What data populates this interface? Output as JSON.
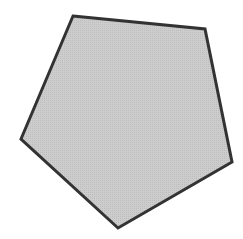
{
  "diagram": {
    "shape": "pentagon",
    "vertices": [
      [
        73,
        16
      ],
      [
        205,
        29
      ],
      [
        232,
        162
      ],
      [
        118,
        228
      ],
      [
        21,
        139
      ]
    ],
    "fill_color": "#c9c9c9",
    "stroke_color": "#333333",
    "stroke_width": 3
  }
}
